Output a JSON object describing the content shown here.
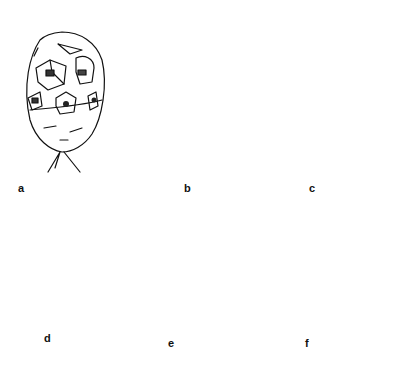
{
  "figure": {
    "panels": [
      {
        "id": "a",
        "label": "a",
        "subject": "rounded gall with box-like chambers (shaded cells) and short root",
        "label_pos": [
          18,
          183
        ]
      },
      {
        "id": "b",
        "label": "b",
        "subject": "gall with five spotted curling finger-like lobes and root",
        "label_pos": [
          184,
          183
        ]
      },
      {
        "id": "c",
        "label": "c",
        "subject": "elongated loop-shaped gall with striped dark opening at top",
        "label_pos": [
          309,
          183
        ]
      },
      {
        "id": "d",
        "label": "d",
        "subject": "stippled rounded pear-shaped gall with short root",
        "label_pos": [
          44,
          333
        ]
      },
      {
        "id": "e",
        "label": "e",
        "subject": "gall with knob head, split body and scalloped stippled cup base",
        "label_pos": [
          168,
          338
        ]
      },
      {
        "id": "f",
        "label": "f",
        "subject": "two dotted cone-shaped galls with ridged rims and granular base",
        "label_pos": [
          305,
          338
        ]
      }
    ],
    "stroke_color": "#111111",
    "background": "#ffffff"
  }
}
